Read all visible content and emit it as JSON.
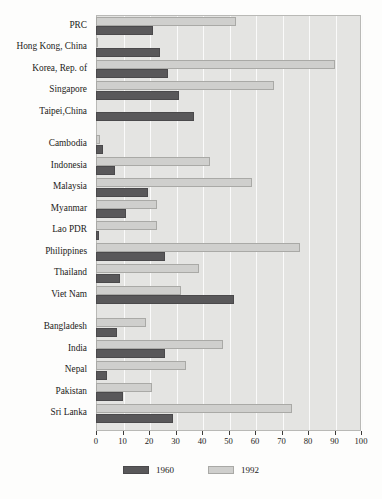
{
  "chart_data": {
    "type": "bar",
    "orientation": "horizontal",
    "title": "",
    "xlabel": "",
    "ylabel": "",
    "xlim": [
      0,
      100
    ],
    "xticks": [
      0,
      10,
      20,
      30,
      40,
      50,
      60,
      70,
      80,
      90,
      100
    ],
    "grid": "vertical",
    "legend_position": "bottom",
    "categories": [
      "PRC",
      "Hong Kong, China",
      "Korea, Rep. of",
      "Singapore",
      "Taipei,China",
      "Cambodia",
      "Indonesia",
      "Malaysia",
      "Myanmar",
      "Lao PDR",
      "Philippines",
      "Thailand",
      "Viet Nam",
      "Bangladesh",
      "India",
      "Nepal",
      "Pakistan",
      "Sri Lanka"
    ],
    "group_breaks_after": [
      "Taipei,China",
      "Viet Nam"
    ],
    "series": [
      {
        "name": "1960",
        "color": "#59585a",
        "values": [
          21.5,
          24,
          27,
          31.5,
          37,
          2.5,
          7,
          19.5,
          11.5,
          1,
          26,
          9,
          52,
          8,
          26,
          4,
          10,
          29
        ]
      },
      {
        "name": "1992",
        "color": "#cfcfcd",
        "values": [
          53,
          0.8,
          90,
          67,
          0,
          1.5,
          43,
          59,
          23,
          23,
          77,
          39,
          32,
          19,
          48,
          34,
          21,
          74
        ]
      }
    ]
  },
  "legend": {
    "items": [
      {
        "label": "1960",
        "swatch": "dark-gray-swatch"
      },
      {
        "label": "1992",
        "swatch": "light-gray-swatch"
      }
    ]
  }
}
